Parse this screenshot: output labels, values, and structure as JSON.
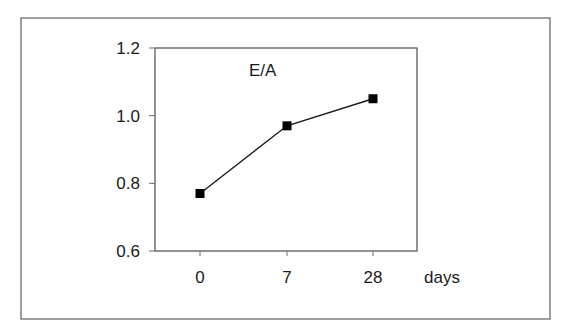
{
  "chart_data": {
    "type": "line",
    "title": "",
    "annotation": "E/A",
    "xlabel": "days",
    "ylabel": "",
    "categories": [
      "0",
      "7",
      "28"
    ],
    "series": [
      {
        "name": "E/A",
        "values": [
          0.77,
          0.97,
          1.05
        ],
        "marker": "square",
        "color": "#000000"
      }
    ],
    "ylim": [
      0.6,
      1.2
    ],
    "yticks": [
      0.6,
      0.8,
      1.0,
      1.2
    ],
    "ytick_labels": [
      "0.6",
      "0.8",
      "1.0",
      "1.2"
    ],
    "grid": false,
    "legend": "none"
  }
}
